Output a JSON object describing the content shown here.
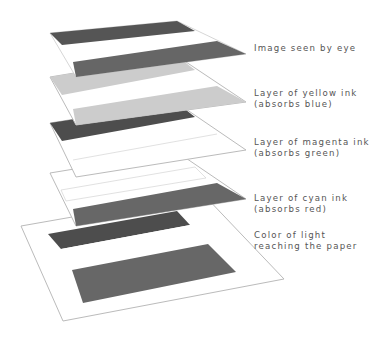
{
  "layers": [
    {
      "id": "eye",
      "label_line1": "Image seen by eye",
      "label_line2": ""
    },
    {
      "id": "yellow",
      "label_line1": "Layer of yellow ink",
      "label_line2": "(absorbs blue)"
    },
    {
      "id": "magenta",
      "label_line1": "Layer of magenta ink",
      "label_line2": "(absorbs green)"
    },
    {
      "id": "cyan",
      "label_line1": "Layer of cyan ink",
      "label_line2": "(absorbs red)"
    },
    {
      "id": "paper",
      "label_line1": "Color of light",
      "label_line2": "reaching the paper"
    }
  ],
  "colors": {
    "background": "#ffffff",
    "outline": "#bbbbbb",
    "eye_band_top": "#555555",
    "eye_band_bottom": "#666666",
    "yellow_band": "#cccccc",
    "magenta_band": "#4d4d4d",
    "cyan_band": "#676767",
    "label_text": "#555555"
  }
}
